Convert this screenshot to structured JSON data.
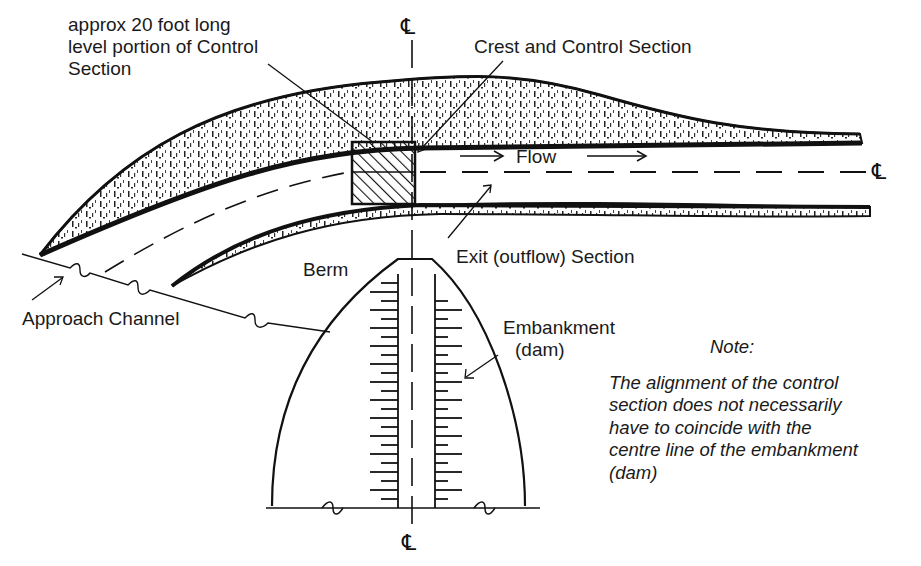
{
  "labels": {
    "level_portion": [
      "approx 20 foot long",
      "level portion of Control",
      "Section"
    ],
    "crest": "Crest and Control Section",
    "flow": "Flow",
    "exit": "Exit (outflow) Section",
    "berm": "Berm",
    "approach": "Approach Channel",
    "embankment": [
      "Embankment",
      "(dam)"
    ],
    "centreline_symbol": "℄"
  },
  "note": {
    "title": "Note:",
    "lines": [
      "The alignment of the control",
      "section does not necessarily",
      "have to coincide with the",
      "centre line of the embankment",
      "(dam)"
    ]
  },
  "colors": {
    "ink": "#111111",
    "background": "#ffffff"
  }
}
